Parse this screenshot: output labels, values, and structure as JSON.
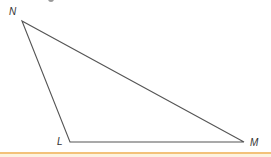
{
  "figure": {
    "type": "triangle",
    "vertices": [
      {
        "name": "N",
        "x": 22,
        "y": 21
      },
      {
        "name": "L",
        "x": 70,
        "y": 142
      },
      {
        "name": "M",
        "x": 244,
        "y": 142
      }
    ],
    "edges": [
      {
        "from": "N",
        "to": "L"
      },
      {
        "from": "L",
        "to": "M"
      },
      {
        "from": "M",
        "to": "N"
      }
    ],
    "labels": {
      "n": "N",
      "l": "L",
      "m": "M"
    },
    "stroke_color": "#555555"
  },
  "footer": {
    "rule_color": "#f3c27a",
    "fill_color": "#fdf3e1"
  }
}
